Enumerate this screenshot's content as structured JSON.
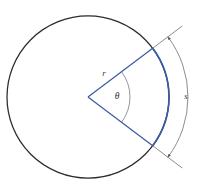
{
  "figure": {
    "background_color": "#ffffff"
  },
  "labels": {
    "radius": "r",
    "angle": "θ",
    "arc_length": "s"
  },
  "colors": {
    "circle_stroke": "#2b2b2b",
    "sector_stroke": "#3b5aa3",
    "dimension_stroke": "#6e6e6e",
    "angle_arc_stroke": "#7a7a7a",
    "label_fill": "#3a3a3a",
    "background": "#ffffff"
  },
  "geometry": {
    "circle": {
      "center_x": 88,
      "center_y": 97,
      "radius": 81
    },
    "sector": {
      "start_angle_deg": -37,
      "end_angle_deg": 37,
      "central_angle_deg": 74
    },
    "angle_arc": {
      "radius": 42
    },
    "dimension_arc": {
      "radius": 100
    },
    "label_positions": {
      "radius_x": 104,
      "radius_y": 76,
      "angle_x": 117,
      "angle_y": 99,
      "arc_length_x": 186,
      "arc_length_y": 99
    }
  }
}
